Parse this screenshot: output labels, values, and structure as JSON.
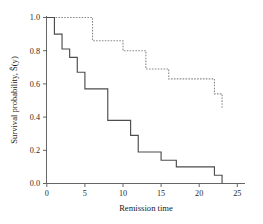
{
  "chart_data": {
    "type": "line",
    "title": "",
    "subtitle": "",
    "xlabel": "Remission time",
    "ylabel": "Survival probability, Ŝ(y)",
    "xlim": [
      0,
      26
    ],
    "ylim": [
      0.0,
      1.0
    ],
    "xticks": [
      0,
      5,
      10,
      15,
      20,
      25
    ],
    "xticklabels": [
      "0",
      "5",
      "10",
      "15",
      "20",
      "25"
    ],
    "yticks": [
      0.0,
      0.2,
      0.4,
      0.6,
      0.8,
      1.0
    ],
    "yticklabels": [
      "0.0",
      "0.2",
      "0.4",
      "0.6",
      "0.8",
      "1.0"
    ],
    "grid": false,
    "legend": "none",
    "drawstyle": "steps-post",
    "series": [
      {
        "name": "treatment-group-dashed",
        "style": "dashed",
        "color": "#8a8a8a",
        "x": [
          0,
          6,
          10,
          13,
          16,
          22,
          23
        ],
        "y": [
          1.0,
          0.86,
          0.8,
          0.69,
          0.63,
          0.54,
          0.45
        ]
      },
      {
        "name": "control-group-solid",
        "style": "solid",
        "color": "#4d4d4d",
        "x": [
          0,
          1,
          2,
          3,
          4,
          5,
          8,
          11,
          12,
          15,
          17,
          22,
          23
        ],
        "y": [
          1.0,
          0.9,
          0.81,
          0.76,
          0.67,
          0.57,
          0.38,
          0.29,
          0.19,
          0.14,
          0.1,
          0.05,
          0.0
        ]
      }
    ],
    "annotations": []
  },
  "axes": {
    "y_axis_name": "survival-probability-axis",
    "x_axis_name": "remission-time-axis"
  }
}
